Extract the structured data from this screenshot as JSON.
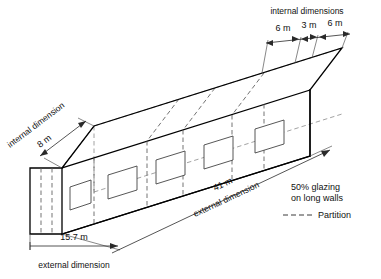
{
  "figure": {
    "type": "isometric-building-diagram"
  },
  "dimensions": {
    "top": {
      "caption": "internal dimensions",
      "segments": [
        {
          "label": "6 m",
          "value": 6,
          "unit": "m"
        },
        {
          "label": "3 m",
          "value": 3,
          "unit": "m"
        },
        {
          "label": "6 m",
          "value": 6,
          "unit": "m"
        }
      ]
    },
    "left": {
      "caption": "internal dimension",
      "label": "8 m",
      "value": 8,
      "unit": "m"
    },
    "bottom": {
      "caption": "external dimension",
      "label": "15.7 m",
      "value": 15.7,
      "unit": "m"
    },
    "length": {
      "caption": "external dimension",
      "label": "41 m",
      "value": 41,
      "unit": "m"
    }
  },
  "legend": {
    "glazing_line1": "50% glazing",
    "glazing_line2": "on long walls",
    "partition_label": "Partition"
  },
  "geometry": {
    "window_count_long_wall": 5,
    "partition_count_end_wall": 2
  },
  "colors": {
    "outline": "#000000",
    "partition": "#5a5a5a",
    "hidden_edge": "#8a8a8a",
    "background": "#ffffff",
    "text": "#111111"
  }
}
